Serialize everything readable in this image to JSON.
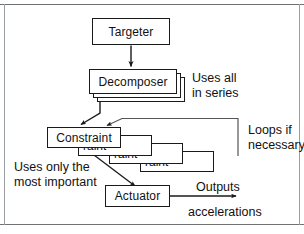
{
  "figure": {
    "nodes": {
      "targeter": "Targeter",
      "decomposer": "Decomposer",
      "constraint": "Constraint",
      "constraint_partial": "raint",
      "actuator": "Actuator"
    },
    "annotations": {
      "uses_all_line1": "Uses all",
      "uses_all_line2": "in series",
      "loops_line1": "Loops if",
      "loops_line2": "necessary",
      "uses_only_line1": "Uses only the",
      "uses_only_line2": "most important",
      "outputs_line1": "Outputs",
      "outputs_line2": "accelerations"
    },
    "colors": {
      "stroke": "#1a1a1a",
      "frame": "#6f7375",
      "background": "#ffffff",
      "loop_line": "#555555"
    },
    "edges": [
      {
        "name": "targeter-to-decomposer",
        "from": "Targeter",
        "to": "Decomposer",
        "arrow": true
      },
      {
        "name": "decomposer-to-constraint",
        "from": "Decomposer",
        "to": "Constraint",
        "arrow": true
      },
      {
        "name": "constraint-loop-back",
        "from": "Constraint stack",
        "to": "Constraint",
        "arrow": true,
        "label": "Loops if necessary"
      },
      {
        "name": "constraint-to-actuator",
        "from": "Constraint",
        "to": "Actuator",
        "arrow": true,
        "label": "Uses only the most important"
      },
      {
        "name": "actuator-output",
        "from": "Actuator",
        "to": "output",
        "arrow": true,
        "label": "Outputs accelerations"
      }
    ]
  }
}
